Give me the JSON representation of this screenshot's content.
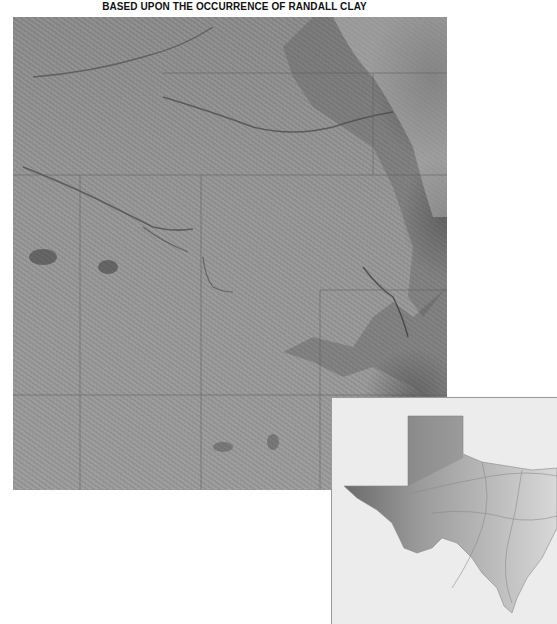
{
  "title": "BASED UPON THE OCCURRENCE OF RANDALL CLAY",
  "main_map": {
    "type": "shaded-relief",
    "grid": {
      "vertical_lines_x": [
        67,
        188,
        307
      ],
      "horizontal_lines_y": [
        56,
        158,
        273,
        378
      ]
    },
    "colors": {
      "plain": "#959595",
      "dark_relief": "#3a3a3a",
      "light_relief": "#e8e8e8",
      "grid": "#666666"
    }
  },
  "inset_map": {
    "subject": "Texas state outline with shaded elevation",
    "colors": {
      "background": "#ececec",
      "highlight": "#6e6e6e",
      "roads": "#9a9a9a"
    }
  }
}
